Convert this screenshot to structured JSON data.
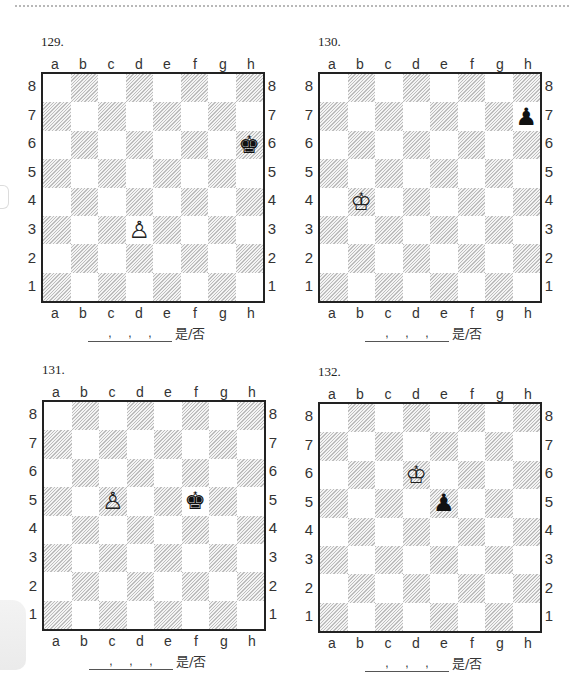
{
  "page": {
    "answer_suffix": "是/否",
    "answer_commas": [
      ",",
      ",",
      ","
    ]
  },
  "board_labels": {
    "files": [
      "a",
      "b",
      "c",
      "d",
      "e",
      "f",
      "g",
      "h"
    ],
    "ranks": [
      "8",
      "7",
      "6",
      "5",
      "4",
      "3",
      "2",
      "1"
    ]
  },
  "problems": [
    {
      "number": "129.",
      "pieces": [
        {
          "square": "h6",
          "type": "king",
          "color": "black",
          "glyph": "♚"
        },
        {
          "square": "d3",
          "type": "pawn",
          "color": "white",
          "glyph": "♙"
        }
      ]
    },
    {
      "number": "130.",
      "pieces": [
        {
          "square": "h7",
          "type": "pawn",
          "color": "black",
          "glyph": "♟"
        },
        {
          "square": "b4",
          "type": "king",
          "color": "white",
          "glyph": "♔"
        }
      ]
    },
    {
      "number": "131.",
      "pieces": [
        {
          "square": "c5",
          "type": "pawn",
          "color": "white",
          "glyph": "♙"
        },
        {
          "square": "f5",
          "type": "king",
          "color": "black",
          "glyph": "♚"
        }
      ]
    },
    {
      "number": "132.",
      "pieces": [
        {
          "square": "d6",
          "type": "king",
          "color": "white",
          "glyph": "♔"
        },
        {
          "square": "e5",
          "type": "pawn",
          "color": "black",
          "glyph": "♟"
        }
      ]
    }
  ]
}
